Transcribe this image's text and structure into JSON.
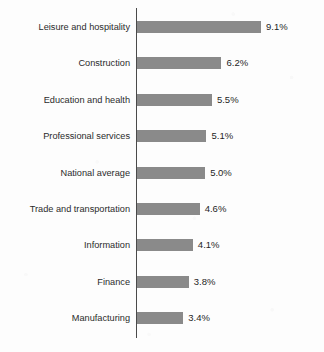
{
  "chart_data": {
    "type": "bar",
    "orientation": "horizontal",
    "title": "",
    "subtitle": "",
    "xlabel": "",
    "ylabel": "",
    "grid": false,
    "legend": null,
    "axis_line": "vertical-category-axis",
    "value_suffix": "%",
    "xlim": [
      0,
      9.1
    ],
    "categories": [
      "Leisure and hospitality",
      "Construction",
      "Education and health",
      "Professional services",
      "National average",
      "Trade and transportation",
      "Information",
      "Finance",
      "Manufacturing"
    ],
    "values": [
      9.1,
      6.2,
      5.5,
      5.1,
      5.0,
      4.6,
      4.1,
      3.8,
      3.4
    ],
    "value_labels": [
      "9.1%",
      "6.2%",
      "5.5%",
      "5.1%",
      "5.0%",
      "4.6%",
      "4.1%",
      "3.8%",
      "3.4%"
    ],
    "colors": {
      "bar": "#8a8a8a",
      "axis": "#4a4a4a",
      "label_text": "#2b2b2b",
      "value_text": "#1f1f1f",
      "background": "#fdfdfd"
    }
  }
}
